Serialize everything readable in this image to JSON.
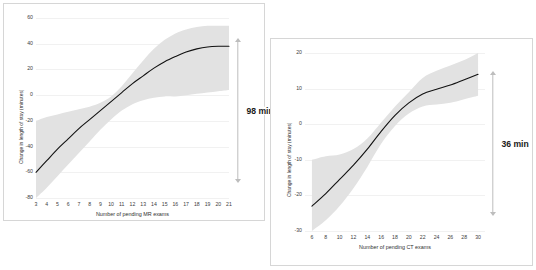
{
  "figure": {
    "background_color": "#ffffff",
    "panel_border_color": "#d6d6d6",
    "gridline_color": "#f1f1f1",
    "curve_color": "#111111",
    "band_color": "#e2e2e2",
    "arrow_color": "#bdbdbd"
  },
  "charts": [
    {
      "id": "mr",
      "annotation": "98 min",
      "chart_data": {
        "type": "line",
        "title": "",
        "xlabel": "Number of pending MR exams",
        "ylabel": "Change in length of stay (minutes)",
        "xlim": [
          3,
          21
        ],
        "ylim": [
          -80,
          60
        ],
        "xticks": [
          3,
          4,
          5,
          6,
          7,
          8,
          9,
          10,
          11,
          12,
          13,
          14,
          15,
          16,
          17,
          18,
          19,
          20,
          21
        ],
        "yticks": [
          60,
          40,
          20,
          0,
          -20,
          -40,
          -60,
          -80
        ],
        "grid": true,
        "legend": "none",
        "annotations": [
          {
            "text": "98 min",
            "meaning": "total change in length of stay across pending-exam range"
          }
        ],
        "series": [
          {
            "name": "Predicted change in length of stay",
            "x": [
              3,
              4,
              5,
              6,
              7,
              8,
              9,
              10,
              11,
              12,
              13,
              14,
              15,
              16,
              17,
              18,
              19,
              20,
              21
            ],
            "values": [
              -60,
              -51,
              -42,
              -34,
              -26,
              -19,
              -12,
              -5,
              2,
              9,
              15,
              21,
              26,
              30,
              33.5,
              36,
              37.5,
              38,
              38
            ]
          },
          {
            "name": "95% confidence band upper",
            "x": [
              3,
              4,
              5,
              6,
              7,
              8,
              9,
              10,
              11,
              12,
              13,
              14,
              15,
              16,
              17,
              18,
              19,
              20,
              21
            ],
            "values": [
              -20,
              -17,
              -15,
              -13,
              -11,
              -9,
              -6,
              -1,
              7,
              17,
              27,
              36,
              43,
              48,
              51,
              53,
              54,
              54,
              54
            ]
          },
          {
            "name": "95% confidence band lower",
            "x": [
              3,
              4,
              5,
              6,
              7,
              8,
              9,
              10,
              11,
              12,
              13,
              14,
              15,
              16,
              17,
              18,
              19,
              20,
              21
            ],
            "values": [
              -80,
              -72,
              -63,
              -54,
              -45,
              -36,
              -27,
              -19,
              -12,
              -7,
              -4,
              -2,
              -1,
              -1,
              0,
              1,
              2,
              3,
              4
            ]
          }
        ]
      }
    },
    {
      "id": "ct",
      "annotation": "36 min",
      "chart_data": {
        "type": "line",
        "title": "",
        "xlabel": "Number of pending CT exams",
        "ylabel": "Change in length of stay (minutes)",
        "xlim": [
          5,
          31
        ],
        "ylim": [
          -30,
          20
        ],
        "xticks": [
          6,
          8,
          10,
          12,
          14,
          16,
          18,
          20,
          22,
          24,
          26,
          28,
          30
        ],
        "yticks": [
          20,
          10,
          0,
          -10,
          -20,
          -30
        ],
        "grid": true,
        "legend": "none",
        "annotations": [
          {
            "text": "36 min",
            "meaning": "total change in length of stay across pending-exam range"
          }
        ],
        "series": [
          {
            "name": "Predicted change in length of stay",
            "x": [
              6,
              8,
              10,
              12,
              14,
              16,
              18,
              20,
              22,
              24,
              26,
              28,
              30
            ],
            "values": [
              -23,
              -19.5,
              -15.5,
              -11.5,
              -7,
              -2,
              2.5,
              6,
              8.5,
              9.8,
              11,
              12.5,
              14
            ]
          },
          {
            "name": "95% confidence band upper",
            "x": [
              6,
              8,
              10,
              12,
              14,
              16,
              18,
              20,
              22,
              24,
              26,
              28,
              30
            ],
            "values": [
              -10,
              -9,
              -8.5,
              -7,
              -4,
              0.5,
              5,
              9,
              13,
              15,
              16.5,
              18,
              20
            ]
          },
          {
            "name": "95% confidence band lower",
            "x": [
              6,
              8,
              10,
              12,
              14,
              16,
              18,
              20,
              22,
              24,
              26,
              28,
              30
            ],
            "values": [
              -30,
              -27,
              -23,
              -18,
              -12,
              -5.5,
              -0.5,
              3,
              5,
              5.5,
              6,
              7,
              8
            ]
          }
        ]
      }
    }
  ]
}
